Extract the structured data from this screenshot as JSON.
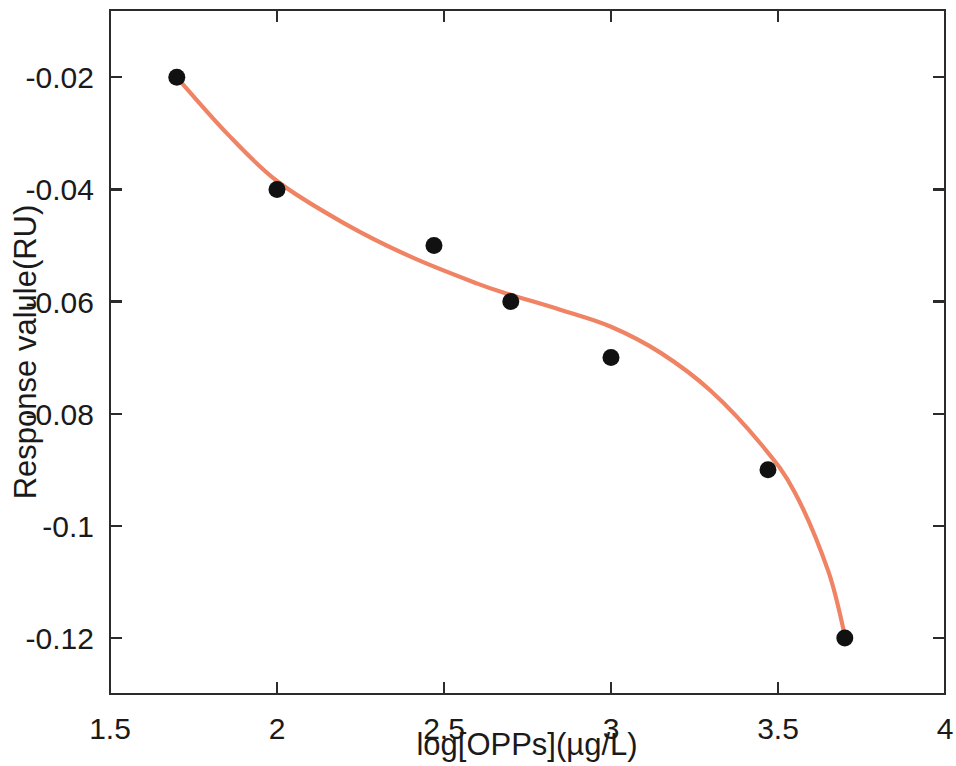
{
  "figure": {
    "width": 956,
    "height": 766,
    "background": "#ffffff"
  },
  "chart_data": {
    "type": "scatter",
    "title": "",
    "xlabel": "log[OPPs](µg/L)",
    "ylabel": "Response valule(RU)",
    "xlim": [
      1.5,
      4
    ],
    "ylim": [
      -0.13,
      -0.008
    ],
    "xticks": [
      1.5,
      2,
      2.5,
      3,
      3.5,
      4
    ],
    "xticklabels": [
      "1.5",
      "2",
      "2.5",
      "3",
      "3.5",
      "4"
    ],
    "yticks": [
      -0.02,
      -0.04,
      -0.06,
      -0.08,
      -0.1,
      -0.12
    ],
    "yticklabels": [
      "-0.02",
      "-0.04",
      "-0.06",
      "-0.08",
      "-0.1",
      "-0.12"
    ],
    "grid": false,
    "legend": null,
    "series": [
      {
        "name": "Measured response",
        "type": "scatter",
        "marker": "filled-circle",
        "marker_color": "#111111",
        "marker_size": 17,
        "x": [
          1.7,
          2.0,
          2.47,
          2.7,
          3.0,
          3.47,
          3.7
        ],
        "y": [
          -0.02,
          -0.04,
          -0.05,
          -0.06,
          -0.07,
          -0.09,
          -0.12
        ]
      },
      {
        "name": "Fitted curve",
        "type": "line",
        "line_color": "#ef8363",
        "line_width": 4.2,
        "x": [
          1.7,
          1.85,
          2.0,
          2.2,
          2.4,
          2.6,
          2.7,
          2.85,
          3.0,
          3.15,
          3.3,
          3.45,
          3.55,
          3.65,
          3.7
        ],
        "y": [
          -0.02,
          -0.03,
          -0.0385,
          -0.046,
          -0.052,
          -0.0568,
          -0.0588,
          -0.0615,
          -0.0645,
          -0.0692,
          -0.076,
          -0.0855,
          -0.094,
          -0.108,
          -0.1195
        ]
      }
    ]
  },
  "axes": {
    "frame_color": "#2b2b2b",
    "tick_direction": "in",
    "left_px": 110,
    "right_px": 945,
    "top_px": 10,
    "bottom_px": 694
  }
}
